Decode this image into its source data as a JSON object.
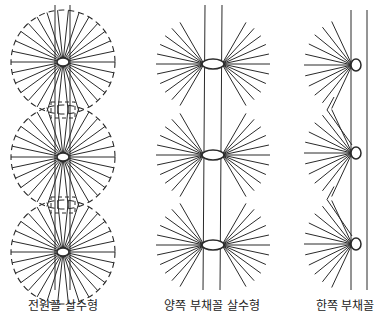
{
  "figure": {
    "panels": [
      {
        "id": "full-circle",
        "caption": "전원꼴 살수형",
        "center_x": 63,
        "hubs_y": [
          62,
          157,
          252
        ],
        "radius": 52,
        "boundary": "dashed-circle",
        "spokes": "full"
      },
      {
        "id": "double-fan",
        "caption": "양쪽 부채꼴 살수형",
        "center_x": 213,
        "hubs_y": [
          64,
          155,
          245
        ],
        "radius": 48,
        "boundary": "none",
        "spokes": "both-sides"
      },
      {
        "id": "single-fan",
        "caption": "한쪽 부채꼴",
        "center_x": 352,
        "hubs_y": [
          65,
          153,
          244
        ],
        "radius": 48,
        "boundary": "zigzag",
        "spokes": "left-side"
      }
    ],
    "colors": {
      "line": "#2a2a2a",
      "background": "#ffffff"
    }
  }
}
